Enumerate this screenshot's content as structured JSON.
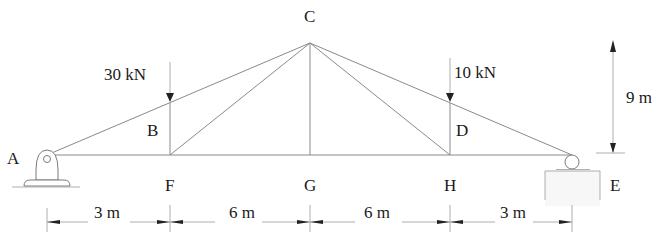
{
  "diagram": {
    "type": "truss",
    "nodes": {
      "A": {
        "label": "A",
        "x": 0,
        "y": 0
      },
      "F": {
        "label": "F",
        "x": 3,
        "y": 0
      },
      "G": {
        "label": "G",
        "x": 9,
        "y": 0
      },
      "H": {
        "label": "H",
        "x": 15,
        "y": 0
      },
      "E": {
        "label": "E",
        "x": 18,
        "y": 0
      },
      "B": {
        "label": "B",
        "x": 3,
        "y": 4.5
      },
      "C": {
        "label": "C",
        "x": 9,
        "y": 9
      },
      "D": {
        "label": "D",
        "x": 15,
        "y": 4.5
      }
    },
    "members": [
      "AB",
      "BC",
      "CD",
      "DE",
      "AF",
      "FG",
      "GH",
      "HE",
      "BF",
      "FC",
      "CG",
      "CH",
      "DH"
    ],
    "supports": {
      "A": "pin",
      "E": "roller"
    },
    "loads": [
      {
        "node": "B",
        "label": "30 kN",
        "direction": "down"
      },
      {
        "node": "D",
        "label": "10 kN",
        "direction": "down"
      }
    ],
    "dimensions": {
      "horizontal": [
        {
          "label": "3 m",
          "from": "A",
          "to": "F"
        },
        {
          "label": "6 m",
          "from": "F",
          "to": "G"
        },
        {
          "label": "6 m",
          "from": "G",
          "to": "H"
        },
        {
          "label": "3 m",
          "from": "H",
          "to": "E"
        }
      ],
      "vertical": {
        "label": "9 m",
        "from": "base",
        "to": "C"
      }
    }
  }
}
